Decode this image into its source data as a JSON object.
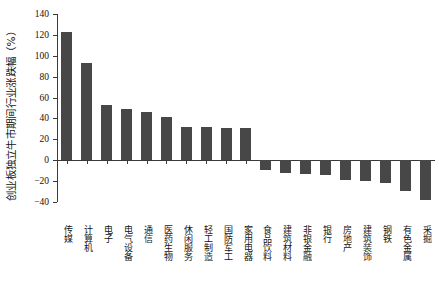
{
  "chart_data": {
    "type": "bar",
    "title": "",
    "subtitle": "",
    "xlabel": "",
    "ylabel": "创业板独立牛市期间行业涨跌幅（%）",
    "ylim": [
      -40,
      140
    ],
    "yticks": [
      -40,
      -20,
      0,
      20,
      40,
      60,
      80,
      100,
      120,
      140
    ],
    "ytick_labels": [
      "−40",
      "−20",
      "0",
      "20",
      "40",
      "60",
      "80",
      "100",
      "120",
      "140"
    ],
    "grid": false,
    "legend": null,
    "bar_color": "#474747",
    "axis_color": "#3a3a3a",
    "categories": [
      "传媒",
      "计算机",
      "电子",
      "电气设备",
      "通信",
      "医药生物",
      "休闲服务",
      "轻工制造",
      "国防军工",
      "家用电器",
      "食品饮料",
      "建筑材料",
      "非银金融",
      "银行",
      "房地产",
      "建筑装饰",
      "钢铁",
      "有色金属",
      "采掘"
    ],
    "values": [
      123,
      93,
      53,
      49,
      46,
      41,
      32,
      32,
      31,
      31,
      -9,
      -12,
      -13,
      -14,
      -19,
      -20,
      -22,
      -30,
      -38
    ],
    "series": [
      {
        "name": "行业涨跌幅",
        "values": [
          123,
          93,
          53,
          49,
          46,
          41,
          32,
          32,
          31,
          31,
          -9,
          -12,
          -13,
          -14,
          -19,
          -20,
          -22,
          -30,
          -38
        ]
      }
    ]
  }
}
